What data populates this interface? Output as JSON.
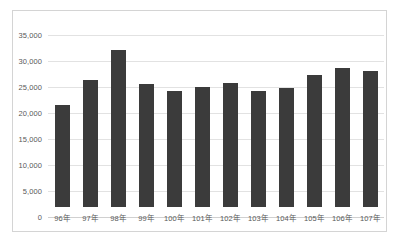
{
  "chart_data": {
    "type": "bar",
    "title": "",
    "subtitle": "",
    "xlabel": "",
    "ylabel": "",
    "categories": [
      "96年",
      "97年",
      "98年",
      "99年",
      "100年",
      "101年",
      "102年",
      "103年",
      "104年",
      "105年",
      "106年",
      "107年"
    ],
    "values": [
      19600,
      24400,
      30100,
      23700,
      22400,
      23000,
      23800,
      22400,
      22900,
      25300,
      26800,
      26100
    ],
    "series": [
      {
        "name": "",
        "values": [
          19600,
          24400,
          30100,
          23700,
          22400,
          23000,
          23800,
          22400,
          22900,
          25300,
          26800,
          26100
        ]
      }
    ],
    "ylim": [
      0,
      35000
    ],
    "ytick_values": [
      0,
      5000,
      10000,
      15000,
      20000,
      25000,
      30000,
      35000
    ],
    "ytick_labels": [
      "0",
      "5,000",
      "10,000",
      "15,000",
      "20,000",
      "25,000",
      "30,000",
      "35,000"
    ],
    "grid": true,
    "grid_axis": "y",
    "legend": false,
    "legend_position": "none",
    "bar_color": "#3b3b3b",
    "gridline_color": "#e2e2e2",
    "axis_label_color": "#595959",
    "plot_background": "#ffffff",
    "frame_border_color": "#d4d4d4"
  }
}
